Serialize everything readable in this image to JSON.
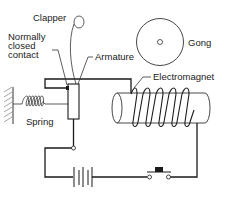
{
  "diagram": {
    "labels": {
      "clapper": "Clapper",
      "contact_line1": "Normally",
      "contact_line2": "closed",
      "contact_line3": "contact",
      "armature": "Armature",
      "gong": "Gong",
      "electromagnet": "Electromagnet",
      "spring": "Spring"
    },
    "components": [
      "clapper",
      "normally-closed-contact",
      "armature",
      "gong",
      "electromagnet",
      "spring",
      "battery",
      "push-switch"
    ],
    "colors": {
      "line": "#1a1a1a",
      "text": "#222222",
      "background": "#ffffff"
    }
  }
}
